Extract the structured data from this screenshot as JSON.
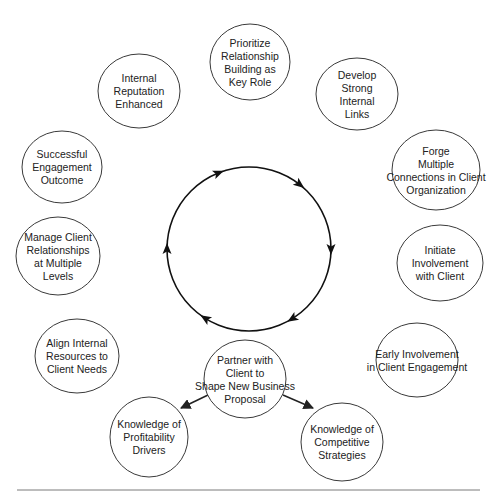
{
  "diagram": {
    "type": "cycle-diagram",
    "cycle_direction": "clockwise",
    "colors": {
      "stroke": "#3a3a3a",
      "text": "#222222",
      "ring": "#111111",
      "background": "#ffffff"
    },
    "cycle_nodes": [
      {
        "id": "prioritize",
        "lines": [
          "Prioritize",
          "Relationship",
          "Building as",
          "Key Role"
        ],
        "cx": 250,
        "cy": 62,
        "rx": 40,
        "ry": 38
      },
      {
        "id": "develop",
        "lines": [
          "Develop",
          "Strong",
          "Internal",
          "Links"
        ],
        "cx": 357,
        "cy": 94,
        "rx": 41,
        "ry": 36
      },
      {
        "id": "forge",
        "lines": [
          "Forge",
          "Multiple",
          "Connections in Client",
          "Organization"
        ],
        "cx": 436,
        "cy": 170,
        "rx": 44,
        "ry": 40
      },
      {
        "id": "initiate",
        "lines": [
          "Initiate",
          "Involvement",
          "with Client"
        ],
        "cx": 440,
        "cy": 263,
        "rx": 43,
        "ry": 38
      },
      {
        "id": "early",
        "lines": [
          "Early Involvement",
          "in Client Engagement"
        ],
        "cx": 417,
        "cy": 360,
        "rx": 41,
        "ry": 37
      },
      {
        "id": "partner",
        "lines": [
          "Partner with",
          "Client to",
          "Shape New Business",
          "Proposal"
        ],
        "cx": 245,
        "cy": 379,
        "rx": 41,
        "ry": 39
      },
      {
        "id": "align",
        "lines": [
          "Align Internal",
          "Resources to",
          "Client Needs"
        ],
        "cx": 77,
        "cy": 356,
        "rx": 42,
        "ry": 37
      },
      {
        "id": "manage",
        "lines": [
          "Manage Client",
          "Relationships",
          "at Multiple",
          "Levels"
        ],
        "cx": 58,
        "cy": 256,
        "rx": 42,
        "ry": 39
      },
      {
        "id": "successful",
        "lines": [
          "Successful",
          "Engagement",
          "Outcome"
        ],
        "cx": 62,
        "cy": 167,
        "rx": 40,
        "ry": 36
      },
      {
        "id": "reputation",
        "lines": [
          "Internal",
          "Reputation",
          "Enhanced"
        ],
        "cx": 139,
        "cy": 91,
        "rx": 41,
        "ry": 37
      }
    ],
    "branch_nodes": [
      {
        "id": "profitability",
        "lines": [
          "Knowledge of",
          "Profitability",
          "Drivers"
        ],
        "cx": 149,
        "cy": 437,
        "rx": 39,
        "ry": 40
      },
      {
        "id": "competitive",
        "lines": [
          "Knowledge of",
          "Competitive",
          "Strategies"
        ],
        "cx": 342,
        "cy": 442,
        "rx": 41,
        "ry": 39
      }
    ],
    "branch_edges": [
      {
        "from": "partner",
        "to": "profitability",
        "x1": 208,
        "y1": 395,
        "x2": 181,
        "y2": 408
      },
      {
        "from": "partner",
        "to": "competitive",
        "x1": 283,
        "y1": 395,
        "x2": 313,
        "y2": 408
      }
    ],
    "ring": {
      "cx": 249,
      "cy": 249,
      "r": 82
    },
    "ring_arrow_angles_deg": [
      -112,
      -52,
      0,
      58,
      122,
      180
    ],
    "rules": {
      "top": {
        "x1": 15,
        "x2": 485,
        "y": 2
      },
      "bottom": {
        "x1": 17,
        "x2": 480,
        "y": 490
      }
    }
  }
}
